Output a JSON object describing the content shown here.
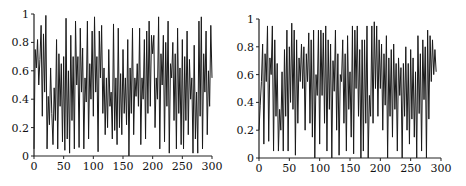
{
  "chart_data": [
    {
      "type": "line",
      "title": "",
      "xlabel": "",
      "ylabel": "",
      "xlim": [
        0,
        300
      ],
      "ylim": [
        0,
        1
      ],
      "grid": false,
      "legend": null,
      "xticks": [
        "0",
        "50",
        "100",
        "150",
        "200",
        "250",
        "300"
      ],
      "yticks": [
        "0",
        "0.2",
        "0.4",
        "0.6",
        "0.8",
        "1"
      ],
      "x_step": 2,
      "series": [
        {
          "name": "left",
          "values": [
            0.05,
            0.75,
            0.62,
            0.82,
            0.5,
            0.68,
            0.92,
            0.28,
            0.86,
            0.45,
            0.99,
            0.05,
            0.42,
            0.22,
            0.62,
            0.3,
            0.08,
            0.48,
            0.25,
            0.82,
            0.05,
            0.72,
            0.35,
            0.65,
            0.1,
            0.7,
            0.04,
            0.97,
            0.12,
            0.6,
            0.02,
            0.85,
            0.25,
            0.7,
            0.05,
            0.95,
            0.5,
            0.7,
            0.06,
            0.9,
            0.45,
            0.76,
            0.05,
            0.55,
            0.38,
            0.95,
            0.12,
            0.65,
            0.4,
            0.88,
            0.28,
            0.98,
            0.45,
            0.7,
            0.03,
            0.88,
            0.55,
            0.92,
            0.3,
            0.62,
            0.15,
            0.55,
            0.2,
            0.75,
            0.35,
            0.45,
            0.12,
            0.93,
            0.18,
            0.55,
            0.08,
            0.9,
            0.2,
            0.58,
            0.15,
            0.75,
            0.3,
            0.55,
            0.22,
            0.82,
            0.0,
            0.62,
            0.3,
            0.9,
            0.15,
            0.55,
            0.42,
            0.65,
            0.35,
            0.9,
            0.08,
            0.55,
            0.4,
            0.82,
            0.12,
            0.88,
            0.3,
            0.95,
            0.35,
            0.85,
            0.72,
            0.85,
            0.2,
            0.55,
            0.4,
            0.98,
            0.05,
            0.72,
            0.5,
            0.85,
            0.1,
            0.8,
            0.35,
            0.95,
            0.02,
            0.65,
            0.55,
            0.8,
            0.25,
            0.72,
            0.05,
            0.9,
            0.3,
            0.62,
            0.08,
            0.82,
            0.05,
            0.7,
            0.25,
            0.88,
            0.15,
            0.68,
            0.4,
            0.55,
            0.02,
            0.78,
            0.12,
            0.45,
            0.02,
            0.95,
            0.28,
            0.98,
            0.05,
            0.72,
            0.45,
            0.88,
            0.15,
            0.6,
            0.35,
            0.92,
            0.55
          ]
        }
      ]
    },
    {
      "type": "line",
      "title": "",
      "xlabel": "",
      "ylabel": "",
      "xlim": [
        0,
        300
      ],
      "ylim": [
        0,
        1
      ],
      "grid": false,
      "legend": null,
      "xticks": [
        "0",
        "50",
        "100",
        "150",
        "200",
        "250",
        "300"
      ],
      "yticks": [
        "0",
        "0.2",
        "0.4",
        "0.6",
        "0.8",
        "1"
      ],
      "x_step": 2,
      "series": [
        {
          "name": "right",
          "values": [
            0.2,
            0.38,
            0.55,
            0.82,
            0.1,
            0.75,
            0.55,
            0.95,
            0.12,
            0.72,
            0.6,
            0.95,
            0.05,
            0.85,
            0.3,
            0.68,
            0.05,
            0.35,
            0.2,
            0.62,
            0.05,
            0.78,
            0.3,
            0.92,
            0.05,
            0.8,
            0.4,
            0.97,
            0.35,
            0.92,
            0.02,
            0.85,
            0.25,
            0.72,
            0.55,
            0.82,
            0.5,
            0.8,
            0.2,
            0.75,
            0.55,
            0.9,
            0.25,
            0.85,
            0.15,
            0.92,
            0.0,
            0.6,
            0.45,
            0.92,
            0.1,
            0.92,
            0.45,
            0.9,
            0.25,
            0.95,
            0.05,
            0.85,
            0.35,
            0.82,
            0.0,
            0.7,
            0.48,
            0.92,
            0.2,
            0.75,
            0.02,
            0.6,
            0.55,
            0.85,
            0.25,
            0.75,
            0.05,
            0.88,
            0.35,
            0.62,
            0.15,
            0.95,
            0.03,
            0.92,
            0.5,
            0.95,
            0.3,
            0.78,
            0.0,
            0.85,
            0.05,
            0.85,
            0.25,
            0.95,
            0.0,
            0.45,
            0.3,
            0.95,
            0.25,
            0.98,
            0.5,
            0.95,
            0.3,
            0.85,
            0.5,
            0.82,
            0.2,
            0.75,
            0.38,
            0.88,
            0.0,
            0.72,
            0.3,
            0.78,
            0.15,
            0.82,
            0.35,
            0.68,
            0.05,
            0.72,
            0.45,
            0.65,
            0.0,
            0.68,
            0.3,
            0.8,
            0.2,
            0.68,
            0.1,
            0.78,
            0.28,
            0.72,
            0.15,
            0.62,
            0.0,
            0.88,
            0.32,
            0.75,
            0.05,
            0.85,
            0.42,
            0.8,
            0.0,
            0.92,
            0.28,
            0.88,
            0.55,
            0.85,
            0.6,
            0.78,
            0.62
          ]
        }
      ]
    }
  ]
}
